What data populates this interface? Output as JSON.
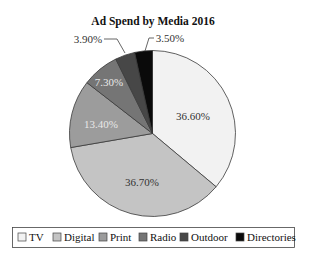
{
  "chart_data": {
    "type": "pie",
    "title": "Ad Spend by Media 2016",
    "categories": [
      "TV",
      "Digital",
      "Print",
      "Radio",
      "Outdoor",
      "Directories"
    ],
    "values": [
      36.6,
      36.7,
      13.4,
      7.3,
      3.9,
      3.5
    ],
    "labels": [
      "36.60%",
      "36.70%",
      "13.40%",
      "7.30%",
      "3.90%",
      "3.50%"
    ],
    "colors": [
      "#f2f2f2",
      "#c4c4c4",
      "#9c9c9c",
      "#757575",
      "#474747",
      "#0a0a0a"
    ],
    "label_colors": [
      "#333333",
      "#333333",
      "#e8e8e8",
      "#e8e8e8",
      "#333333",
      "#333333"
    ],
    "start_angle": "12 o'clock",
    "direction": "clockwise",
    "legend_position": "bottom",
    "xlabel": "",
    "ylabel": ""
  },
  "legend": {
    "items": [
      {
        "label": "TV",
        "color": "#f2f2f2"
      },
      {
        "label": "Digital",
        "color": "#c4c4c4"
      },
      {
        "label": "Print",
        "color": "#9c9c9c"
      },
      {
        "label": "Radio",
        "color": "#757575"
      },
      {
        "label": "Outdoor",
        "color": "#474747"
      },
      {
        "label": "Directories",
        "color": "#0a0a0a"
      }
    ]
  }
}
